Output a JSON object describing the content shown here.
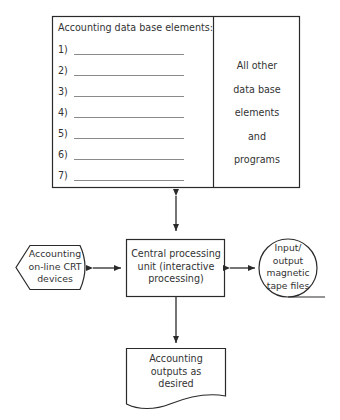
{
  "database_box": {
    "title": "Accounting data base elements:",
    "items": [
      {
        "num": "1)"
      },
      {
        "num": "2)"
      },
      {
        "num": "3)"
      },
      {
        "num": "4)"
      },
      {
        "num": "5)"
      },
      {
        "num": "6)"
      },
      {
        "num": "7)"
      }
    ],
    "other_lines": [
      "All other",
      "data base",
      "elements",
      "and",
      "programs"
    ]
  },
  "cpu": {
    "lines": [
      "Central processing",
      "unit (interactive",
      "processing)"
    ]
  },
  "crt": {
    "lines": [
      "Accounting",
      "on-line CRT",
      "devices"
    ]
  },
  "tape": {
    "lines": [
      "Input/",
      "output",
      "magnetic",
      "tape files"
    ]
  },
  "output_doc": {
    "lines": [
      "Accounting",
      "outputs as",
      "desired"
    ]
  },
  "colors": {
    "stroke": "#2a2a2a",
    "text": "#333333",
    "blank_line": "#8a8a8a"
  }
}
